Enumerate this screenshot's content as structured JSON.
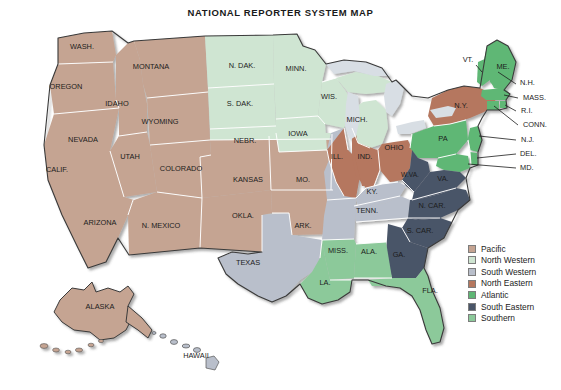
{
  "title": "NATIONAL REPORTER SYSTEM MAP",
  "colors": {
    "pacific": "#c5a492",
    "north_western": "#cfe5d2",
    "south_western": "#b9bfcb",
    "north_eastern": "#b5775e",
    "atlantic": "#5fb775",
    "south_eastern": "#4a5568",
    "southern": "#8cc99a",
    "lakes": "#d8dee4",
    "ocean": "#ffffff",
    "border": "#ffffff",
    "outline": "#3a3a3a",
    "label": "#1c1c1c"
  },
  "legend": {
    "items": [
      {
        "label": "Pacific",
        "color": "#c5a492"
      },
      {
        "label": "North Western",
        "color": "#cfe5d2"
      },
      {
        "label": "South Western",
        "color": "#b9bfcb"
      },
      {
        "label": "North Eastern",
        "color": "#b5775e"
      },
      {
        "label": "Atlantic",
        "color": "#5fb775"
      },
      {
        "label": "South Eastern",
        "color": "#4a5568"
      },
      {
        "label": "Southern",
        "color": "#8cc99a"
      }
    ]
  },
  "regions": {
    "pacific": [
      "WASH.",
      "OREGON",
      "IDAHO",
      "MONTANA",
      "WYOMING",
      "NEVADA",
      "CALIF.",
      "UTAH",
      "COLORADO",
      "ARIZONA",
      "N. MEXICO",
      "KANSAS",
      "OKLA.",
      "ALASKA"
    ],
    "north_western": [
      "N. DAK.",
      "S. DAK.",
      "NEBR.",
      "MINN.",
      "IOWA",
      "WIS.",
      "MICH."
    ],
    "south_western": [
      "MO.",
      "ARK.",
      "TEXAS",
      "KY.",
      "TENN."
    ],
    "north_eastern": [
      "ILL.",
      "IND.",
      "OHIO",
      "N.Y."
    ],
    "atlantic": [
      "PA",
      "ME.",
      "VT.",
      "N.H.",
      "MASS.",
      "R.I.",
      "CONN.",
      "N.J.",
      "DEL.",
      "MD."
    ],
    "south_eastern": [
      "W.VA.",
      "VA.",
      "N. CAR.",
      "S. CAR.",
      "GA."
    ],
    "southern": [
      "MISS.",
      "ALA.",
      "LA.",
      "FLA."
    ]
  },
  "state_labels": [
    {
      "name": "WASH.",
      "x": 82,
      "y": 49,
      "size": 7.4
    },
    {
      "name": "OREGON",
      "x": 66,
      "y": 89,
      "size": 7.4
    },
    {
      "name": "IDAHO",
      "x": 117,
      "y": 106,
      "size": 7.4
    },
    {
      "name": "MONTANA",
      "x": 151,
      "y": 69,
      "size": 7.4
    },
    {
      "name": "WYOMING",
      "x": 160,
      "y": 124,
      "size": 7.4
    },
    {
      "name": "NEVADA",
      "x": 83,
      "y": 142,
      "size": 7.4
    },
    {
      "name": "CALIF.",
      "x": 57,
      "y": 172,
      "size": 7.4
    },
    {
      "name": "UTAH",
      "x": 130,
      "y": 159,
      "size": 7.4
    },
    {
      "name": "COLORADO",
      "x": 181,
      "y": 171,
      "size": 7.4
    },
    {
      "name": "ARIZONA",
      "x": 100,
      "y": 225,
      "size": 7.4
    },
    {
      "name": "N. MEXICO",
      "x": 161,
      "y": 228,
      "size": 7.4
    },
    {
      "name": "N. DAK.",
      "x": 242,
      "y": 68,
      "size": 7.4
    },
    {
      "name": "S. DAK.",
      "x": 240,
      "y": 106,
      "size": 7.4
    },
    {
      "name": "NEBR.",
      "x": 245,
      "y": 143,
      "size": 7.4
    },
    {
      "name": "KANSAS",
      "x": 248,
      "y": 182,
      "size": 7.4
    },
    {
      "name": "OKLA.",
      "x": 243,
      "y": 218,
      "size": 7.4
    },
    {
      "name": "TEXAS",
      "x": 248,
      "y": 265,
      "size": 7.4
    },
    {
      "name": "MINN.",
      "x": 296,
      "y": 71,
      "size": 7.4
    },
    {
      "name": "IOWA",
      "x": 298,
      "y": 136,
      "size": 7.4
    },
    {
      "name": "MO.",
      "x": 303,
      "y": 182,
      "size": 7.4
    },
    {
      "name": "ARK.",
      "x": 303,
      "y": 228,
      "size": 7.4
    },
    {
      "name": "WIS.",
      "x": 329,
      "y": 99,
      "size": 7.4
    },
    {
      "name": "MICH.",
      "x": 357,
      "y": 122,
      "size": 7.4
    },
    {
      "name": "ILL.",
      "x": 337,
      "y": 159,
      "size": 7.4
    },
    {
      "name": "IND.",
      "x": 365,
      "y": 159,
      "size": 7.4
    },
    {
      "name": "OHIO",
      "x": 394,
      "y": 150,
      "size": 7.4
    },
    {
      "name": "KY.",
      "x": 372,
      "y": 194,
      "size": 7.4
    },
    {
      "name": "TENN.",
      "x": 367,
      "y": 213,
      "size": 7.4
    },
    {
      "name": "MISS.",
      "x": 338,
      "y": 253,
      "size": 7.4
    },
    {
      "name": "ALA.",
      "x": 369,
      "y": 254,
      "size": 7.4
    },
    {
      "name": "LA.",
      "x": 325,
      "y": 285,
      "size": 7.4
    },
    {
      "name": "GA.",
      "x": 399,
      "y": 257,
      "size": 7.4
    },
    {
      "name": "FLA.",
      "x": 430,
      "y": 293,
      "size": 7.4
    },
    {
      "name": "S. CAR.",
      "x": 420,
      "y": 233,
      "size": 7.4
    },
    {
      "name": "N. CAR.",
      "x": 432,
      "y": 208,
      "size": 7.4
    },
    {
      "name": "W.VA.",
      "x": 410,
      "y": 177,
      "size": 6.6
    },
    {
      "name": "VA.",
      "x": 443,
      "y": 181,
      "size": 7.4
    },
    {
      "name": "PA",
      "x": 443,
      "y": 141,
      "size": 7.4
    },
    {
      "name": "N.Y.",
      "x": 461,
      "y": 108,
      "size": 7.4
    },
    {
      "name": "ME.",
      "x": 503,
      "y": 69,
      "size": 7.4
    },
    {
      "name": "VT.",
      "x": 468,
      "y": 62,
      "size": 7.4
    },
    {
      "name": "ALASKA",
      "x": 100,
      "y": 309,
      "size": 7.4
    },
    {
      "name": "HAWAII",
      "x": 196,
      "y": 358,
      "size": 7.4
    }
  ],
  "callout_labels": [
    {
      "name": "N.H.",
      "x": 520,
      "y": 85
    },
    {
      "name": "MASS.",
      "x": 523,
      "y": 100
    },
    {
      "name": "R.I.",
      "x": 521,
      "y": 113
    },
    {
      "name": "CONN.",
      "x": 523,
      "y": 127
    },
    {
      "name": "N.J.",
      "x": 521,
      "y": 142
    },
    {
      "name": "DEL.",
      "x": 520,
      "y": 156
    },
    {
      "name": "MD.",
      "x": 520,
      "y": 170
    }
  ]
}
